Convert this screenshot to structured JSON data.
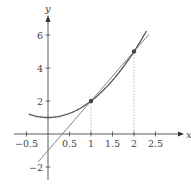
{
  "chart_data": {
    "type": "line",
    "title": "",
    "xlabel": "x",
    "ylabel": "y",
    "xlim": [
      -0.6,
      2.9
    ],
    "ylim": [
      -2.8,
      6.9
    ],
    "x_ticks": [
      -0.5,
      0.5,
      1,
      1.5,
      2,
      2.5
    ],
    "x_tick_labels": [
      "−0.5",
      "0.5",
      "1",
      "1.5",
      "2",
      "2.5"
    ],
    "y_ticks": [
      -2,
      2,
      4,
      6
    ],
    "y_tick_labels": [
      "−2",
      "2",
      "4",
      "6"
    ],
    "grid": false,
    "legend": null,
    "series": [
      {
        "name": "curve y = x^2 + 1",
        "x": [
          -0.45,
          0,
          0.5,
          1,
          1.5,
          2,
          2.3
        ],
        "y": [
          1.2,
          1,
          1.25,
          2,
          3.25,
          5,
          6.29
        ]
      },
      {
        "name": "secant line y = 3x - 1",
        "x": [
          -0.23,
          2.35
        ],
        "y": [
          -1.69,
          6.05
        ]
      }
    ],
    "points": [
      {
        "x": 1,
        "y": 2
      },
      {
        "x": 2,
        "y": 5
      }
    ],
    "annotations": [
      "dotted vertical guide from (1,0) to (1,2)",
      "dotted vertical guide from (2,0) to (2,5)"
    ]
  },
  "colors": {
    "axis": "#333333",
    "curve": "#555555",
    "line": "#777777",
    "point": "#444444",
    "guide": "#aaaaaa"
  }
}
